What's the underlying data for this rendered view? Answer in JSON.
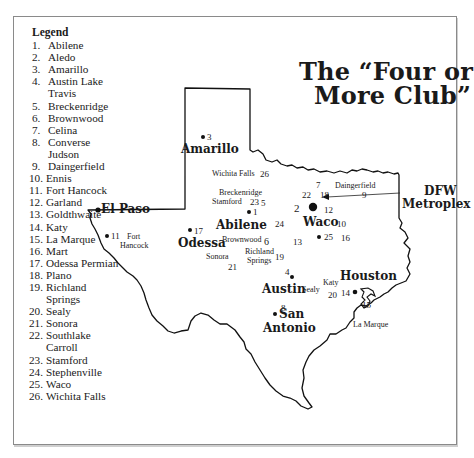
{
  "title": {
    "line1": "The “Four or",
    "line2": "More Club”"
  },
  "legend": {
    "title": "Legend",
    "items": [
      {
        "num": "1.",
        "label": "Abilene"
      },
      {
        "num": "2.",
        "label": "Aledo"
      },
      {
        "num": "3.",
        "label": "Amarillo"
      },
      {
        "num": "4.",
        "label": "Austin Lake\nTravis"
      },
      {
        "num": "5.",
        "label": "Breckenridge"
      },
      {
        "num": "6.",
        "label": "Brownwood"
      },
      {
        "num": "7.",
        "label": "Celina"
      },
      {
        "num": "8.",
        "label": "Converse\nJudson"
      },
      {
        "num": "9.",
        "label": "Daingerfield"
      },
      {
        "num": "10.",
        "label": "Ennis"
      },
      {
        "num": "11.",
        "label": "Fort Hancock"
      },
      {
        "num": "12.",
        "label": "Garland"
      },
      {
        "num": "13.",
        "label": "Goldthwaite"
      },
      {
        "num": "14.",
        "label": "Katy"
      },
      {
        "num": "15.",
        "label": "La Marque"
      },
      {
        "num": "16.",
        "label": "Mart"
      },
      {
        "num": "17.",
        "label": "Odessa Permian"
      },
      {
        "num": "18.",
        "label": "Plano"
      },
      {
        "num": "19.",
        "label": "Richland\nSprings"
      },
      {
        "num": "20.",
        "label": "Sealy"
      },
      {
        "num": "21.",
        "label": "Sonora"
      },
      {
        "num": "22.",
        "label": "Southlake\nCarroll"
      },
      {
        "num": "23.",
        "label": "Stamford"
      },
      {
        "num": "24.",
        "label": "Stephenville"
      },
      {
        "num": "25.",
        "label": "Waco"
      },
      {
        "num": "26.",
        "label": "Wichita Falls"
      }
    ]
  },
  "map": {
    "major_cities": {
      "el_paso": "El Paso",
      "amarillo": "Amarillo",
      "odessa": "Odessa",
      "abilene": "Abilene",
      "waco": "Waco",
      "dfw_line1": "DFW",
      "dfw_line2": "Metroplex",
      "austin": "Austin",
      "san_antonio_line1": "San",
      "san_antonio_line2": "Antonio",
      "houston": "Houston"
    },
    "place_labels": {
      "fort": "Fort",
      "hancock": "Hancock",
      "wichita_falls": "Wichita Falls",
      "breckenridge": "Breckenridge",
      "stamford": "Stamford",
      "daingerfield": "Daingerfield",
      "brownwood": "Brownwood",
      "sonora": "Sonora",
      "richland": "Richland",
      "springs": "Springs",
      "katy": "Katy",
      "sealy": "Sealy",
      "la_marque": "La Marque"
    },
    "markers": {
      "n1": "1",
      "n2": "2",
      "n3": "3",
      "n4": "4",
      "n5": "5",
      "n6": "6",
      "n7": "7",
      "n8": "8",
      "n9": "9",
      "n10": "10",
      "n11": "11",
      "n12": "12",
      "n13": "13",
      "n14": "14",
      "n15": "15",
      "n16": "16",
      "n17": "17",
      "n18": "18",
      "n19": "19",
      "n20": "20",
      "n21": "21",
      "n22": "22",
      "n23": "23",
      "n24": "24",
      "n25": "25",
      "n26": "26"
    }
  }
}
